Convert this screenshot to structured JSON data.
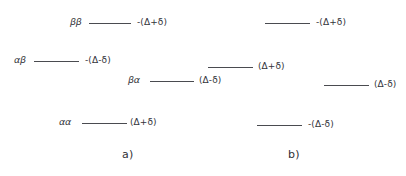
{
  "figure": {
    "background_color": "#ffffff",
    "line_color": "#4a4b50",
    "text_color": "#33343a",
    "width": 406,
    "height": 176
  },
  "panels": [
    {
      "id": "a",
      "caption": "a)",
      "caption_x": 122,
      "caption_y": 148,
      "levels": [
        {
          "state": "ββ",
          "energy": "-(Δ+δ)",
          "x": 70,
          "y": 14,
          "state_width": 18,
          "line_width": 42,
          "label_gap": 4
        },
        {
          "state": "αβ",
          "energy": "-(Δ-δ)",
          "x": 14,
          "y": 52,
          "state_width": 19,
          "line_width": 45,
          "label_gap": 4
        },
        {
          "state": "βα",
          "energy": "(Δ-δ)",
          "x": 128,
          "y": 72,
          "state_width": 21,
          "line_width": 44,
          "label_gap": 3
        },
        {
          "state": "αα",
          "energy": "(Δ+δ)",
          "x": 59,
          "y": 114,
          "state_width": 22,
          "line_width": 45,
          "label_gap": 1
        }
      ]
    },
    {
      "id": "b",
      "caption": "b)",
      "caption_x": 288,
      "caption_y": 148,
      "levels": [
        {
          "state": "",
          "energy": "-(Δ+δ)",
          "x": 265,
          "y": 14,
          "state_width": 0,
          "line_width": 45,
          "label_gap": 4
        },
        {
          "state": "",
          "energy": "(Δ+δ)",
          "x": 208,
          "y": 58,
          "state_width": 0,
          "line_width": 45,
          "label_gap": 3
        },
        {
          "state": "",
          "energy": "(Δ-δ)",
          "x": 324,
          "y": 76,
          "state_width": 0,
          "line_width": 45,
          "label_gap": 3
        },
        {
          "state": "",
          "energy": "-(Δ-δ)",
          "x": 257,
          "y": 116,
          "state_width": 0,
          "line_width": 45,
          "label_gap": 4
        }
      ]
    }
  ]
}
